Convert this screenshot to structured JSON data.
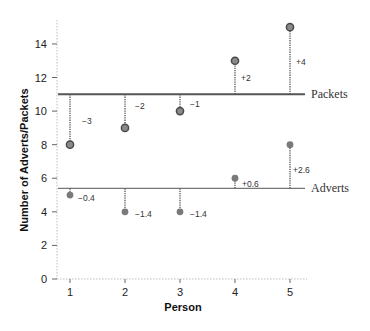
{
  "chart_data": {
    "type": "scatter",
    "title": "",
    "xlabel": "Person",
    "ylabel": "Number of Adverts/Packets",
    "x": [
      1,
      2,
      3,
      4,
      5
    ],
    "xticks": [
      "1",
      "2",
      "3",
      "4",
      "5"
    ],
    "yticks": [
      "0",
      "2",
      "4",
      "6",
      "8",
      "10",
      "12",
      "14"
    ],
    "ylim": [
      0,
      15.5
    ],
    "xlim": [
      0.8,
      5.3
    ],
    "grid": false,
    "series": [
      {
        "name": "Packets",
        "values": [
          8,
          9,
          10,
          13,
          15
        ],
        "mean": 11,
        "deviations": [
          "−3",
          "−2",
          "−1",
          "+2",
          "+4"
        ],
        "line_color": "#555555",
        "marker_fill": "#8a8a8a",
        "marker_stroke": "#4a4a4a"
      },
      {
        "name": "Adverts",
        "values": [
          5,
          4,
          4,
          6,
          8
        ],
        "mean": 5.4,
        "deviations": [
          "−0.4",
          "−1.4",
          "−1.4",
          "+0.6",
          "+2.6"
        ],
        "line_color": "#777777",
        "marker_fill": "#7a7a7a",
        "marker_stroke": "#7a7a7a"
      }
    ],
    "annotations": [
      "Mean lines labelled 'Packets' and 'Adverts' with dotted deviation lines from each point to its mean"
    ]
  }
}
